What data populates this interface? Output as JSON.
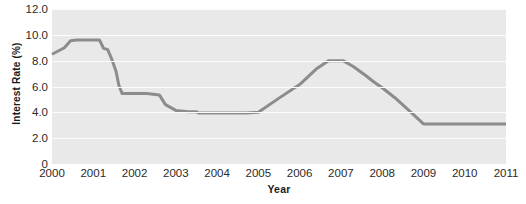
{
  "chart_data": {
    "type": "line",
    "title": "",
    "xlabel": "Year",
    "ylabel": "Interest Rate (%)",
    "xlim": [
      2000,
      2011
    ],
    "ylim": [
      0,
      12
    ],
    "yticks": [
      "12.0",
      "10.0",
      "8.0",
      "6.0",
      "4.0",
      "2.0",
      "0"
    ],
    "ytick_values": [
      12.0,
      10.0,
      8.0,
      6.0,
      4.0,
      2.0,
      0
    ],
    "xticks": [
      "2000",
      "2001",
      "2002",
      "2003",
      "2004",
      "2005",
      "2006",
      "2007",
      "2008",
      "2009",
      "2010",
      "2011"
    ],
    "xtick_values": [
      2000,
      2001,
      2002,
      2003,
      2004,
      2005,
      2006,
      2007,
      2008,
      2009,
      2010,
      2011
    ],
    "grid": true,
    "legend": "none",
    "plot_background": "#e9e9e9",
    "gridline_color": "#fbfbfb",
    "series": [
      {
        "name": "Interest Rate",
        "color": "#8c8c8c",
        "line_width": 3,
        "x": [
          2000.0,
          2000.15,
          2000.3,
          2000.45,
          2000.6,
          2000.75,
          2001.0,
          2001.15,
          2001.25,
          2001.35,
          2001.45,
          2001.55,
          2001.62,
          2001.7,
          2002.0,
          2002.3,
          2002.45,
          2002.6,
          2002.75,
          2003.0,
          2003.3,
          2003.5,
          2003.55,
          2004.0,
          2004.5,
          2004.7,
          2005.0,
          2005.5,
          2006.0,
          2006.4,
          2006.7,
          2007.05,
          2007.3,
          2007.6,
          2007.8,
          2008.0,
          2008.3,
          2008.7,
          2009.0,
          2009.5,
          2010.0,
          2010.5,
          2011.0
        ],
        "y": [
          8.5,
          8.75,
          9.0,
          9.55,
          9.6,
          9.6,
          9.6,
          9.6,
          8.95,
          8.85,
          8.1,
          7.2,
          6.1,
          5.45,
          5.45,
          5.45,
          5.4,
          5.35,
          4.6,
          4.15,
          4.05,
          4.05,
          3.95,
          3.95,
          3.95,
          3.95,
          4.0,
          5.1,
          6.15,
          7.35,
          8.0,
          8.0,
          7.55,
          6.85,
          6.35,
          5.9,
          5.15,
          4.0,
          3.1,
          3.1,
          3.1,
          3.1,
          3.1
        ]
      }
    ],
    "annotations": []
  }
}
